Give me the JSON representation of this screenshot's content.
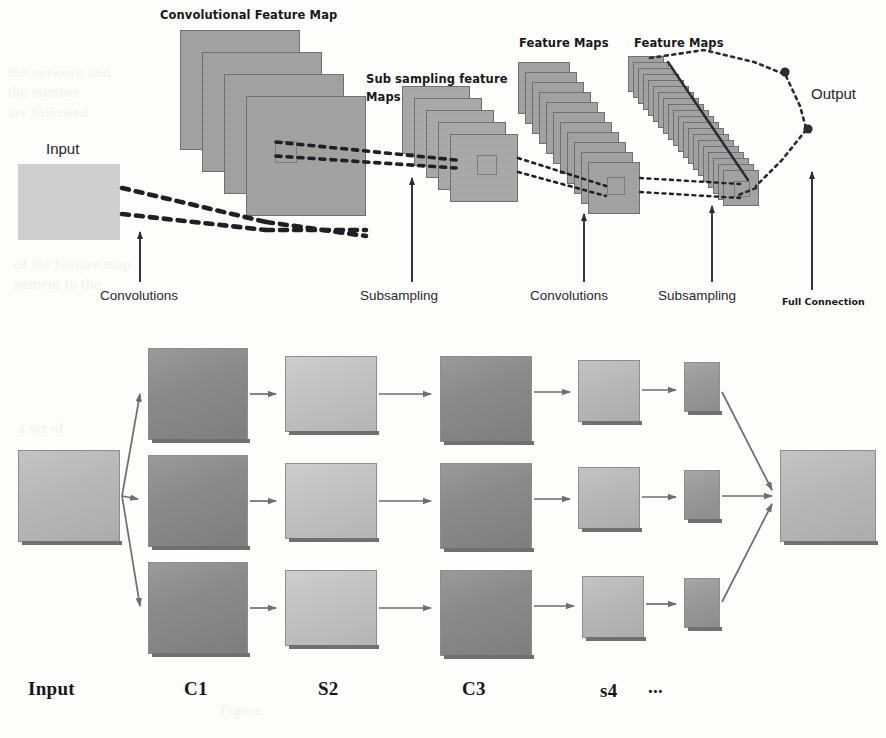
{
  "figure": {
    "ink_color": "#24242a",
    "plane_fill": "#a2a2a2",
    "plane_stroke": "#6f6f6f",
    "box_dark": "#8a8a8a",
    "box_light": "#c0c0c0",
    "background": "#fdfdfc"
  },
  "top_diagram": {
    "labels": {
      "conv_feature_map": "Convolutional Feature Map",
      "sub_sampling_feature_maps": "Sub sampling feature\nMaps",
      "sub_sampling_line1": "Sub sampling feature",
      "sub_sampling_line2": "Maps",
      "feature_maps_1": "Feature Maps",
      "feature_maps_2": "Feature Maps",
      "input": "Input",
      "output": "Output"
    },
    "axis_labels": [
      {
        "id": "convolutions-1",
        "text": "Convolutions",
        "x": 100,
        "y": 296,
        "tick_x": 140
      },
      {
        "id": "subsampling-1",
        "text": "Subsampling",
        "x": 360,
        "y": 296,
        "tick_x": 412
      },
      {
        "id": "convolutions-2",
        "text": "Convolutions",
        "x": 530,
        "y": 296,
        "tick_x": 584
      },
      {
        "id": "subsampling-2",
        "text": "Subsampling",
        "x": 658,
        "y": 296,
        "tick_x": 712
      },
      {
        "id": "full-connection",
        "text": "Full Connection",
        "x": 782,
        "y": 300,
        "tick_x": 812
      }
    ],
    "stacks": [
      {
        "id": "conv-feature-map-stack",
        "planes": 4,
        "size": 120
      },
      {
        "id": "subsampling-feature-map-stack",
        "planes": 5,
        "size": 68
      },
      {
        "id": "feature-maps-stack-1",
        "planes": 11,
        "size": 52
      },
      {
        "id": "feature-maps-stack-2",
        "planes": 20,
        "size": 36
      }
    ],
    "output_nodes": 2
  },
  "bottom_diagram": {
    "stage_labels": [
      {
        "id": "input",
        "text": "Input",
        "x": 30
      },
      {
        "id": "c1",
        "text": "C1",
        "x": 184
      },
      {
        "id": "s2",
        "text": "S2",
        "x": 318
      },
      {
        "id": "c3",
        "text": "C3",
        "x": 462
      },
      {
        "id": "s4",
        "text": "s4",
        "x": 600
      },
      {
        "id": "ellipsis",
        "text": "...",
        "x": 648
      }
    ],
    "layers": [
      {
        "id": "input-layer",
        "label": "Input",
        "count": 1,
        "shade": "light"
      },
      {
        "id": "c1-layer",
        "label": "C1",
        "count": 3,
        "shade": "dark"
      },
      {
        "id": "s2-layer",
        "label": "S2",
        "count": 3,
        "shade": "light"
      },
      {
        "id": "c3-layer",
        "label": "C3",
        "count": 3,
        "shade": "dark"
      },
      {
        "id": "s4-layer",
        "label": "s4",
        "count": 3,
        "shade": "light"
      },
      {
        "id": "small-layer",
        "label": "",
        "count": 3,
        "shade": "dark"
      },
      {
        "id": "output-layer",
        "label": "",
        "count": 1,
        "shade": "light"
      }
    ]
  },
  "ghost_text": {
    "block_a": "the network and\nthe number\nare followed",
    "block_b": "of the feature map\ngement in the",
    "block_c": "a set of",
    "block_d": "Figure"
  }
}
